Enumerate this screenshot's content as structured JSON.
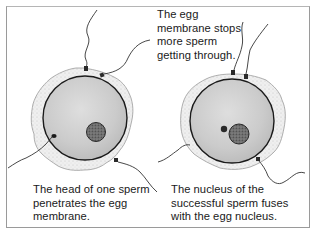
{
  "diagram": {
    "type": "biology-illustration",
    "panels": [
      {
        "id": "left",
        "elements": [
          "egg cell with jelly coat",
          "egg nucleus",
          "sperm head penetrating membrane",
          "sperm tails"
        ],
        "caption_lines": [
          "The head of one sperm",
          "penetrates the egg",
          "membrane."
        ]
      },
      {
        "id": "right",
        "elements": [
          "egg cell with jelly coat",
          "fusing nuclei",
          "blocked sperm at membrane",
          "sperm tails"
        ],
        "caption_lines": [
          "The nucleus of the",
          "successful sperm fuses",
          "with the egg nucleus."
        ]
      }
    ],
    "annotation_top": {
      "lines": [
        "The egg",
        "membrane stops",
        "more sperm",
        "getting through."
      ]
    },
    "colors": {
      "border": "#9a9a9a",
      "cytoplasm": "#cfcfcf",
      "jelly_coat": "#ececec",
      "membrane": "#1a1a1a",
      "nucleus": "#6a6a6a",
      "text": "#1a1a1a"
    }
  }
}
